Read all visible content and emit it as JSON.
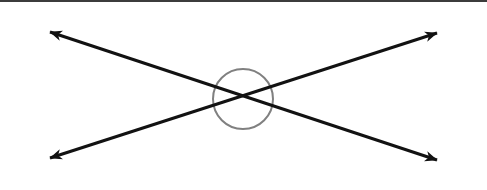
{
  "figure": {
    "width": 487,
    "height": 190,
    "background_color": "#ffffff",
    "top_border": {
      "name": "scan-edge-border",
      "color": "#3c3c3c",
      "thickness_px": 2
    },
    "intersection_point": {
      "x": 243,
      "y": 99
    },
    "angle_circle": {
      "label": "angle-arc-circle",
      "center_x": 243,
      "center_y": 99,
      "radius": 30,
      "stroke_color": "#808080",
      "stroke_width": 2,
      "fill": "none"
    },
    "lines": [
      {
        "label": "line-descending",
        "description": "Double-headed arrow from upper-left to lower-right",
        "start": {
          "x": 50,
          "y": 32
        },
        "end": {
          "x": 437,
          "y": 160
        },
        "stroke_color": "#121212",
        "stroke_width": 3,
        "arrowheads": "both"
      },
      {
        "label": "line-ascending",
        "description": "Double-headed arrow from lower-left to upper-right",
        "start": {
          "x": 50,
          "y": 158
        },
        "end": {
          "x": 437,
          "y": 33
        },
        "stroke_color": "#121212",
        "stroke_width": 3,
        "arrowheads": "both"
      }
    ],
    "arrow_tips": [
      {
        "label": "arrow-tip-top-left",
        "x": 50,
        "y": 32
      },
      {
        "label": "arrow-tip-top-right",
        "x": 437,
        "y": 33
      },
      {
        "label": "arrow-tip-bottom-left",
        "x": 50,
        "y": 158
      },
      {
        "label": "arrow-tip-bottom-right",
        "x": 437,
        "y": 160
      }
    ],
    "labels": {
      "text_annotations": []
    }
  }
}
